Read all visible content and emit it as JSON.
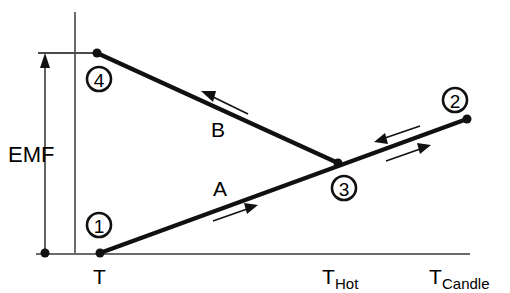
{
  "figure": {
    "type": "schematic-line-diagram",
    "background_color": "#ffffff",
    "line_color": "#111111",
    "axis_color": "#6b6b6b",
    "width": 510,
    "height": 293
  },
  "axes": {
    "y_axis": {
      "label": "EMF",
      "x": 75,
      "y_top": 12,
      "y_bottom": 254
    },
    "x_axis": {
      "y": 254,
      "x_left": 36,
      "x_right": 470
    },
    "x_tick_labels": [
      {
        "main": "T",
        "sub": "",
        "x": 100
      },
      {
        "main": "T",
        "sub": "Hot",
        "x": 338
      },
      {
        "main": "T",
        "sub": "Candle",
        "x": 450
      }
    ],
    "emf_bracket": {
      "label": "EMF",
      "x": 45,
      "top_y": 53,
      "bottom_y": 253,
      "tick_x_start": 38,
      "tick_x_end": 96
    }
  },
  "nodes": [
    {
      "id": "1",
      "label": "1",
      "point_x": 100,
      "point_y": 253,
      "circle_x": 99,
      "circle_y": 225,
      "radius": 12
    },
    {
      "id": "2",
      "label": "2",
      "point_x": 467,
      "point_y": 119,
      "circle_x": 455,
      "circle_y": 100,
      "radius": 12
    },
    {
      "id": "3",
      "label": "3",
      "point_x": 338,
      "point_y": 163,
      "circle_x": 344,
      "circle_y": 188,
      "radius": 12
    },
    {
      "id": "4",
      "label": "4",
      "point_x": 97,
      "point_y": 53,
      "circle_x": 99,
      "circle_y": 79,
      "radius": 12
    }
  ],
  "segments": [
    {
      "name": "A",
      "label": "A",
      "label_x": 222,
      "label_y": 196,
      "from": "1",
      "to": "2",
      "x1": 100,
      "y1": 253,
      "x2": 467,
      "y2": 119
    },
    {
      "name": "B",
      "label": "B",
      "label_x": 220,
      "label_y": 137,
      "from": "4",
      "to": "3",
      "x1": 97,
      "y1": 53,
      "x2": 338,
      "y2": 163
    }
  ],
  "flow_arrows": [
    {
      "name": "arrow-on-B",
      "direction": "up-left",
      "x1": 248,
      "y1": 114,
      "x2": 203,
      "y2": 92
    },
    {
      "name": "arrow-on-A",
      "direction": "right-up",
      "x1": 213,
      "y1": 221,
      "x2": 256,
      "y2": 206
    },
    {
      "name": "arrow-upper-right",
      "direction": "left-down",
      "x1": 420,
      "y1": 126,
      "x2": 376,
      "y2": 141
    },
    {
      "name": "arrow-lower-right",
      "direction": "right-up",
      "x1": 386,
      "y1": 161,
      "x2": 429,
      "y2": 146
    }
  ]
}
